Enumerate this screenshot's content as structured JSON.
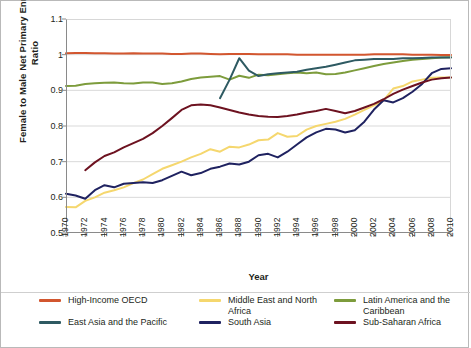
{
  "chart_data": {
    "type": "line",
    "title": "",
    "xlabel": "Year",
    "ylabel": "Female to Male Net Primary Enrollment Ratio",
    "xlim": [
      1970,
      2010
    ],
    "ylim": [
      0.5,
      1.1
    ],
    "yticks": [
      "1.1",
      "1",
      "0.9",
      "0.8",
      "0.7",
      "0.6",
      "0.5"
    ],
    "ytick_values": [
      1.1,
      1.0,
      0.9,
      0.8,
      0.7,
      0.6,
      0.5
    ],
    "xticks": [
      "1970",
      "1972",
      "1974",
      "1976",
      "1978",
      "1980",
      "1982",
      "1984",
      "1986",
      "1988",
      "1990",
      "1992",
      "1994",
      "1996",
      "1998",
      "2000",
      "2002",
      "2004",
      "2006",
      "2008",
      "2010"
    ],
    "grid": "horizontal",
    "legend_position": "bottom",
    "x": [
      1970,
      1971,
      1972,
      1973,
      1974,
      1975,
      1976,
      1977,
      1978,
      1979,
      1980,
      1981,
      1982,
      1983,
      1984,
      1985,
      1986,
      1987,
      1988,
      1989,
      1990,
      1991,
      1992,
      1993,
      1994,
      1995,
      1996,
      1997,
      1998,
      1999,
      2000,
      2001,
      2002,
      2003,
      2004,
      2005,
      2006,
      2007,
      2008,
      2009,
      2010
    ],
    "series": [
      {
        "name": "High-Income OECD",
        "color": "#d2562f",
        "values": [
          1.004,
          1.005,
          1.005,
          1.004,
          1.004,
          1.003,
          1.003,
          1.004,
          1.003,
          1.003,
          1.003,
          1.002,
          1.002,
          1.003,
          1.003,
          1.002,
          1.001,
          1.002,
          1.002,
          1.002,
          1.001,
          1.001,
          1.001,
          1.001,
          1.0,
          1.0,
          1.0,
          1.0,
          1.0,
          1.0,
          1.0,
          1.0,
          1.001,
          1.001,
          1.001,
          1.001,
          1.0,
          1.0,
          1.0,
          0.999,
          0.999
        ]
      },
      {
        "name": "Middle East and North Africa",
        "color": "#f5d76e",
        "values": [
          0.573,
          0.572,
          0.59,
          0.6,
          0.613,
          0.62,
          0.628,
          0.64,
          0.65,
          0.665,
          0.68,
          0.69,
          0.7,
          0.712,
          0.722,
          0.735,
          0.728,
          0.742,
          0.74,
          0.748,
          0.76,
          0.762,
          0.78,
          0.77,
          0.772,
          0.79,
          0.8,
          0.806,
          0.812,
          0.82,
          0.832,
          0.845,
          0.858,
          0.872,
          0.905,
          0.912,
          0.925,
          0.93,
          0.935,
          0.936,
          0.936
        ]
      },
      {
        "name": "Latin America and the Caribbean",
        "color": "#7d9c3c",
        "values": [
          0.912,
          0.913,
          0.918,
          0.92,
          0.921,
          0.922,
          0.92,
          0.919,
          0.922,
          0.922,
          0.918,
          0.92,
          0.925,
          0.932,
          0.936,
          0.938,
          0.94,
          0.93,
          0.941,
          0.935,
          0.944,
          0.942,
          0.945,
          0.948,
          0.95,
          0.948,
          0.95,
          0.945,
          0.946,
          0.95,
          0.956,
          0.962,
          0.968,
          0.974,
          0.978,
          0.982,
          0.986,
          0.988,
          0.99,
          0.992,
          0.993
        ]
      },
      {
        "name": "East Asia and the Pacific",
        "color": "#2e5a62",
        "values": [
          null,
          null,
          null,
          null,
          null,
          null,
          null,
          null,
          null,
          null,
          null,
          null,
          null,
          null,
          null,
          null,
          0.878,
          0.93,
          0.99,
          0.955,
          0.94,
          0.945,
          0.948,
          0.95,
          0.952,
          0.958,
          0.962,
          0.966,
          0.972,
          0.978,
          0.984,
          0.986,
          0.988,
          0.988,
          0.988,
          0.99,
          0.99,
          0.991,
          0.992,
          0.992,
          0.992
        ]
      },
      {
        "name": "South Asia",
        "color": "#1f2260",
        "values": [
          0.61,
          0.605,
          0.596,
          0.62,
          0.634,
          0.628,
          0.638,
          0.64,
          0.642,
          0.64,
          0.648,
          0.66,
          0.672,
          0.662,
          0.668,
          0.68,
          0.686,
          0.695,
          0.692,
          0.7,
          0.718,
          0.722,
          0.712,
          0.728,
          0.748,
          0.768,
          0.782,
          0.792,
          0.79,
          0.782,
          0.788,
          0.812,
          0.846,
          0.872,
          0.866,
          0.878,
          0.896,
          0.918,
          0.948,
          0.96,
          0.962
        ]
      },
      {
        "name": "Sub-Saharan Africa",
        "color": "#6d1220",
        "values": [
          null,
          null,
          0.676,
          0.698,
          0.716,
          0.726,
          0.74,
          0.752,
          0.764,
          0.78,
          0.8,
          0.822,
          0.845,
          0.858,
          0.86,
          0.858,
          0.852,
          0.845,
          0.838,
          0.832,
          0.828,
          0.826,
          0.825,
          0.828,
          0.832,
          0.838,
          0.842,
          0.848,
          0.842,
          0.836,
          0.842,
          0.852,
          0.862,
          0.875,
          0.89,
          0.902,
          0.912,
          0.922,
          0.93,
          0.934,
          0.936
        ]
      }
    ]
  },
  "legend": {
    "items": [
      {
        "label": "High-Income OECD",
        "color": "#d2562f"
      },
      {
        "label": "Middle East and North Africa",
        "color": "#f5d76e"
      },
      {
        "label": "Latin America and the Caribbean",
        "color": "#7d9c3c"
      },
      {
        "label": "East Asia and the Pacific",
        "color": "#2e5a62"
      },
      {
        "label": "South Asia",
        "color": "#1f2260"
      },
      {
        "label": "Sub-Saharan Africa",
        "color": "#6d1220"
      }
    ]
  },
  "axes": {
    "x_title": "Year",
    "y_title": "Female to Male Net Primary Enrollment Ratio"
  }
}
